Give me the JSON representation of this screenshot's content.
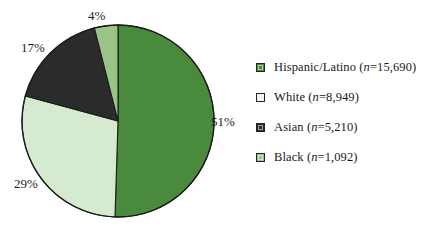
{
  "title": "",
  "chart_data": {
    "type": "pie",
    "title": "",
    "xlabel": "",
    "ylabel": "",
    "legend_position": "right",
    "grid": false,
    "start_angle_deg": 0,
    "direction": "clockwise",
    "categories": [
      "Hispanic/Latino",
      "White",
      "Asian",
      "Black"
    ],
    "values": [
      51,
      29,
      17,
      4
    ],
    "value_unit": "percent",
    "counts": [
      15690,
      8949,
      5210,
      1092
    ],
    "colors": [
      "#4a8a3c",
      "#d6ead0",
      "#2b2b2b",
      "#9ac488"
    ],
    "slices": [
      {
        "label": "Hispanic/Latino",
        "percent": 51,
        "percent_label": "51%",
        "count": 15690,
        "count_label": "15,690",
        "color": "#4a8a3c"
      },
      {
        "label": "White",
        "percent": 29,
        "percent_label": "29%",
        "count": 8949,
        "count_label": "8,949",
        "color": "#d6ead0"
      },
      {
        "label": "Asian",
        "percent": 17,
        "percent_label": "17%",
        "count": 5210,
        "count_label": "5,210",
        "color": "#2b2b2b"
      },
      {
        "label": "Black",
        "percent": 4,
        "percent_label": "4%",
        "count": 1092,
        "count_label": "1,092",
        "color": "#9ac488"
      }
    ]
  },
  "pie": {
    "outline_color": "#1c1c1c",
    "labels": {
      "slice_0": "51%",
      "slice_1": "29%",
      "slice_2": "17%",
      "slice_3": "4%"
    }
  },
  "legend": {
    "items": [
      {
        "name": "Hispanic/Latino",
        "n_prefix": "(",
        "n_symbol": "n",
        "n_value": "=15,690)",
        "text": "Hispanic/Latino (n=15,690)",
        "color": "#4a8a3c"
      },
      {
        "name": "White",
        "n_prefix": "(",
        "n_symbol": "n",
        "n_value": "=8,949)",
        "text": "White (n=8,949)",
        "color": "#f2f2ee"
      },
      {
        "name": "Asian",
        "n_prefix": "(",
        "n_symbol": "n",
        "n_value": "=5,210)",
        "text": "Asian (n=5,210)",
        "color": "#2b2b2b"
      },
      {
        "name": "Black",
        "n_prefix": "(",
        "n_symbol": "n",
        "n_value": "=1,092)",
        "text": "Black (n=1,092)",
        "color": "#9ac488"
      }
    ]
  }
}
